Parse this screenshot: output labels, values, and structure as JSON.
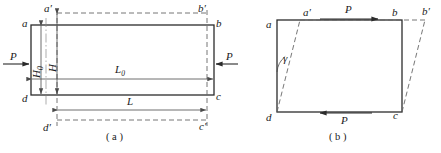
{
  "figure": {
    "title_a": "( a )",
    "title_b": "( b )",
    "colors": {
      "solid_line": "#2b2b2b",
      "dashed_line": "#555555",
      "dimension_line": "#777777",
      "text": "#1a1a1a",
      "background": "#ffffff"
    }
  },
  "diagram_a": {
    "name": "tensile-deformation-diagram",
    "corner_labels": {
      "a": "a",
      "b": "b",
      "c": "c",
      "d": "d",
      "a_prime": "a′",
      "b_prime": "b′",
      "c_prime": "c′",
      "d_prime": "d′"
    },
    "dimensions": [
      {
        "key": "H0",
        "text": "H",
        "subscript": "0",
        "orientation": "vertical"
      },
      {
        "key": "H",
        "text": "H",
        "subscript": "",
        "orientation": "vertical"
      },
      {
        "key": "L0",
        "text": "L",
        "subscript": "0",
        "orientation": "horizontal"
      },
      {
        "key": "L",
        "text": "L",
        "subscript": "",
        "orientation": "horizontal"
      }
    ],
    "forces": [
      {
        "key": "P_left",
        "text": "P",
        "direction": "right"
      },
      {
        "key": "P_right",
        "text": "P",
        "direction": "left"
      }
    ],
    "caption": "( a )"
  },
  "diagram_b": {
    "name": "shear-deformation-diagram",
    "corner_labels": {
      "a": "a",
      "b": "b",
      "c": "c",
      "d": "d",
      "a_prime": "a′",
      "b_prime": "b′"
    },
    "angle_label": "γ",
    "forces": [
      {
        "key": "P_top",
        "text": "P",
        "direction": "right"
      },
      {
        "key": "P_bottom",
        "text": "P",
        "direction": "left"
      }
    ],
    "caption": "( b )"
  }
}
